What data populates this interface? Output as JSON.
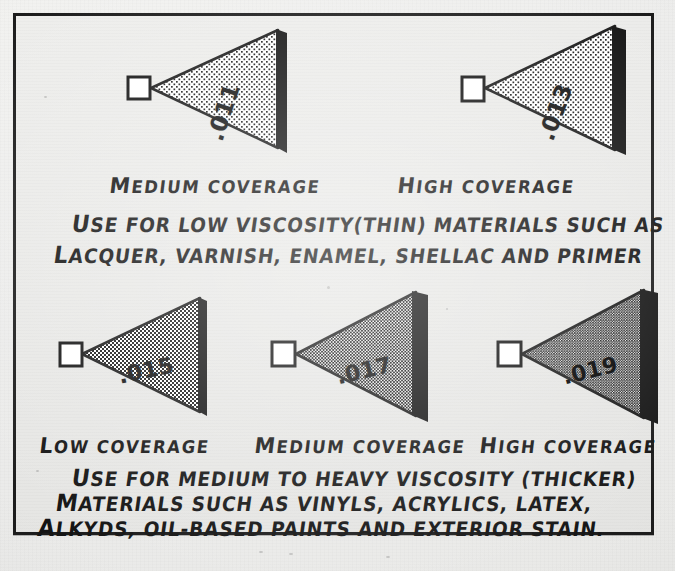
{
  "document": {
    "kind": "hand-drawn spray tip coverage chart",
    "background_color": "#e8e8e6",
    "ink_color": "#141414",
    "frame_color": "#1c1c1c"
  },
  "groups": [
    {
      "id": "low-viscosity",
      "tips": [
        {
          "size": ".011",
          "coverage_label": "Medium Coverage",
          "density": "light"
        },
        {
          "size": ".013",
          "coverage_label": "High Coverage",
          "density": "light"
        }
      ],
      "note_lines": [
        "Use for low viscosity (thin) materials such as",
        "lacquer, varnish, enamel, shellac and primer"
      ]
    },
    {
      "id": "medium-heavy-viscosity",
      "tips": [
        {
          "size": ".015",
          "coverage_label": "Low Coverage",
          "density": "medium"
        },
        {
          "size": ".017",
          "coverage_label": "Medium Coverage",
          "density": "dense"
        },
        {
          "size": ".019",
          "coverage_label": "High Coverage",
          "density": "densest"
        }
      ],
      "note_lines": [
        "Use for medium to heavy viscosity (thicker)",
        "materials such as vinyls, acrylics, latex,",
        "alkyds, oil-based paints and exterior stain."
      ]
    }
  ],
  "labels": {
    "cov_medium": "MEDIUM COVERAGE",
    "cov_high": "HIGH COVERAGE",
    "cov_low": "LOW COVERAGE",
    "note1_l1": "USE FOR LOW VISCOSITY(THIN) MATERIALS SUCH AS",
    "note1_l2": "LACQUER, VARNISH, ENAMEL, SHELLAC AND PRIMER",
    "note2_l1": "USE FOR MEDIUM TO HEAVY VISCOSITY (THICKER)",
    "note2_l2": "MATERIALS SUCH AS VINYLS, ACRYLICS, LATEX,",
    "note2_l3": "ALKYDS, OIL-BASED PAINTS AND EXTERIOR STAIN.",
    "size_011": ".011",
    "size_013": ".013",
    "size_015": ".015",
    "size_017": ".017",
    "size_019": ".019"
  }
}
